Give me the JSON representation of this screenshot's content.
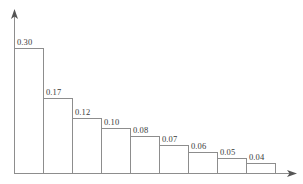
{
  "chart_data": {
    "type": "bar",
    "title": "",
    "subtitle": "",
    "xlabel": "",
    "ylabel": "",
    "grid": false,
    "legend": null,
    "axis_style": "arrow-headed open axes",
    "categories": [
      "1",
      "2",
      "3",
      "4",
      "5",
      "6",
      "7",
      "8",
      "9"
    ],
    "values": [
      0.3,
      0.17,
      0.12,
      0.1,
      0.08,
      0.07,
      0.06,
      0.05,
      0.04
    ],
    "data_labels": [
      "0.30",
      "0.17",
      "0.12",
      "0.10",
      "0.08",
      "0.07",
      "0.06",
      "0.05",
      "0.04"
    ],
    "xlim": [
      0,
      9
    ],
    "ylim": [
      0,
      0.3
    ],
    "xtick_labels": [],
    "ytick_labels": [],
    "colors": {
      "bar_fill": "#ffffff",
      "bar_stroke": "#8d8d8d",
      "axis": "#8d8d8d",
      "arrow": "#555555",
      "label_text": "#3a3a3a",
      "background": "#ffffff"
    }
  },
  "figure": {
    "width": 303,
    "height": 184,
    "plot": {
      "axis_x": 14,
      "baseline_y": 173,
      "bar_width": 29,
      "bar_tops": [
        48,
        98,
        118,
        128,
        136,
        145,
        152,
        158,
        163
      ],
      "y_arrow_tip_y": 10,
      "x_arrow_tip_x": 296
    }
  }
}
